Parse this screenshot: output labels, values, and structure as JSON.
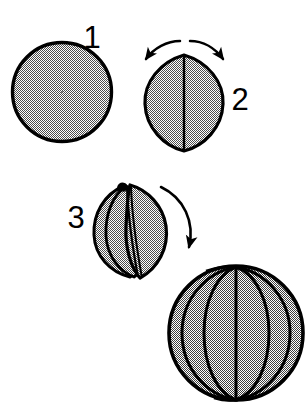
{
  "figure": {
    "background_color": "#ffffff",
    "ink_color": "#000000",
    "fill_pattern": "50-percent-dither-gray",
    "fill_color": "#9b9b9b",
    "width": 307,
    "height": 411,
    "step_labels": [
      {
        "id": "step-1",
        "text": "1",
        "x": 92,
        "y": 48
      },
      {
        "id": "step-2",
        "text": "2",
        "x": 229,
        "y": 110
      },
      {
        "id": "step-3",
        "text": "3",
        "x": 66,
        "y": 228
      }
    ],
    "shapes": [
      {
        "id": "disc",
        "name": "filled-circle",
        "step": "1",
        "cx": 62,
        "cy": 92,
        "r": 50
      },
      {
        "id": "lens",
        "name": "lens-shape",
        "step": "2",
        "cx": 184,
        "cy": 103,
        "half_width": 39,
        "half_height": 48,
        "center_line": true
      },
      {
        "id": "partially-opened-petals",
        "name": "opened-lens-petals",
        "step": "3",
        "cx": 130,
        "cy": 231,
        "half_width": 38,
        "half_height": 47,
        "petal_count": 3
      },
      {
        "id": "assembled-sphere",
        "name": "petal-sphere",
        "step": "4",
        "cx": 236,
        "cy": 333,
        "r": 68,
        "petal_count": 4
      }
    ],
    "arrows": [
      {
        "id": "arrow-open-left",
        "name": "curved-arrow-left",
        "direction": "down-left"
      },
      {
        "id": "arrow-open-right",
        "name": "curved-arrow-right",
        "direction": "down-right"
      },
      {
        "id": "arrow-assemble",
        "name": "curved-arrow-assemble",
        "direction": "down-right"
      }
    ]
  }
}
